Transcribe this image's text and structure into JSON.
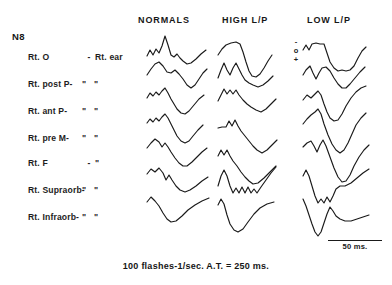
{
  "figure": {
    "subject_id": "N8",
    "caption": "100 flashes-1/sec.  A.T. = 250 ms.",
    "ink_color": "#1a1a1a",
    "background_color": "#ffffff"
  },
  "columns": [
    {
      "id": "normals",
      "label": "NORMALS"
    },
    {
      "id": "high_lp",
      "label": "HIGH L/P"
    },
    {
      "id": "low_lp",
      "label": "LOW L/P"
    }
  ],
  "polarity_key": {
    "negative": "-",
    "zero": "o",
    "positive": "+"
  },
  "scale_bar": {
    "label": "50 ms."
  },
  "rows": [
    {
      "site": "Rt. O",
      "dash": "-",
      "reference": "Rt. ear"
    },
    {
      "site": "Rt. post P-",
      "dash": "\"",
      "reference": "\""
    },
    {
      "site": "Rt. ant P-",
      "dash": "\"",
      "reference": "\""
    },
    {
      "site": "Rt. pre M-",
      "dash": "\"",
      "reference": "\""
    },
    {
      "site": "Rt. F",
      "dash": "-",
      "reference": "\""
    },
    {
      "site": "Rt. Supraorb-",
      "dash": "\"",
      "reference": "\""
    },
    {
      "site": "Rt. Infraorb-",
      "dash": "\"",
      "reference": "\""
    }
  ],
  "chart_data": {
    "type": "line",
    "xlabel": "time (ms)",
    "ylabel": "potential (polarity: - up, + down)",
    "x": [
      0,
      250
    ],
    "grid": false,
    "legend": "none",
    "annotations": [
      "100 flashes-1/sec.  A.T. = 250 ms.",
      "50 ms."
    ],
    "series": [
      {
        "name": "NORMALS / Rt. O - Rt. ear",
        "column": "normals",
        "row": 0,
        "path": "M147,56 L150,50 L153,55 L156,49 L159,53 L162,46 L165,36 L168,45 L171,55 L174,57 L177,54 L180,58 L183,61 L187,64 L191,63 L196,59 L201,54 L206,50"
      },
      {
        "name": "NORMALS / Rt. post P- \"",
        "column": "normals",
        "row": 1,
        "path": "M147,75 L151,69 L155,64 L159,62 L163,66 L167,72 L171,73 L175,70 L179,74 L183,79 L187,85 L191,88 L195,85 L199,79 L203,73 L207,69"
      },
      {
        "name": "NORMALS / Rt. ant P- \"",
        "column": "normals",
        "row": 2,
        "path": "M147,98 L150,93 L153,96 L156,92 L159,95 L162,91 L165,88 L168,93 L171,99 L174,104 L177,109 L181,113 L185,114 L189,111 L194,105 L199,99 L204,95"
      },
      {
        "name": "NORMALS / Rt. pre M- \"",
        "column": "normals",
        "row": 3,
        "path": "M147,123 L150,119 L153,122 L156,118 L159,121 L162,117 L165,114 L168,118 L171,124 L174,130 L177,136 L181,141 L185,143 L189,141 L193,136 L198,130 L203,125"
      },
      {
        "name": "NORMALS / Rt. F - \"",
        "column": "normals",
        "row": 4,
        "path": "M147,148 L151,143 L155,139 L159,142 L162,147 L165,143 L168,147 L171,152 L175,158 L179,163 L183,166 L187,166 L192,162 L197,157 L202,152 L207,148"
      },
      {
        "name": "NORMALS / Rt. Supraorb- \"",
        "column": "normals",
        "row": 5,
        "path": "M147,174 L151,169 L155,172 L159,168 L163,173 L166,180 L169,175 L172,180 L176,186 L180,190 L185,192 L190,190 L196,186 L202,181 L208,177"
      },
      {
        "name": "NORMALS / Rt. Infraorb- \"",
        "column": "normals",
        "row": 6,
        "path": "M147,202 L151,197 L155,201 L159,206 L163,213 L167,219 L171,222 L176,221 L182,216 L188,210 L195,205 L202,201 L209,198"
      },
      {
        "name": "HIGH L/P / Rt. O - Rt. ear",
        "column": "high_lp",
        "row": 0,
        "path": "M218,55 L222,49 L226,45 L231,43 L236,42 L240,44 L243,52 L246,62 L249,71 L252,76 L256,77 L260,74 L264,68 L268,61 L272,55"
      },
      {
        "name": "HIGH L/P / Rt. post P- \"",
        "column": "high_lp",
        "row": 1,
        "path": "M218,78 L221,70 L224,63 L227,70 L230,75 L233,68 L236,63 L239,69 L242,75 L245,80 L249,83 L253,85 L258,87 L263,85 L268,81 L273,76"
      },
      {
        "name": "HIGH L/P / Rt. ant P- \"",
        "column": "high_lp",
        "row": 2,
        "path": "M218,101 L221,95 L224,89 L227,94 L230,90 L233,94 L236,90 L239,95 L243,100 L247,104 L251,107 L256,110 L261,112 L266,109 L271,104 L276,99"
      },
      {
        "name": "HIGH L/P / Rt. pre M- \"",
        "column": "high_lp",
        "row": 3,
        "path": "M218,128 L222,127 L226,127 L229,121 L232,126 L235,120 L238,126 L241,131 L245,136 L249,141 L253,146 L257,150 L262,153 L267,150 L272,145 L277,140"
      },
      {
        "name": "HIGH L/P / Rt. F - \"",
        "column": "high_lp",
        "row": 4,
        "path": "M218,156 L221,150 L224,155 L227,150 L230,156 L233,161 L237,166 L241,172 L245,177 L249,181 L253,184 L258,183 L264,178 L270,172 L276,166"
      },
      {
        "name": "HIGH L/P / Rt. Supraorb- \"",
        "column": "high_lp",
        "row": 5,
        "path": "M218,186 L221,176 L224,170 L227,176 L230,186 L233,193 L236,188 L239,193 L242,187 L245,193 L248,187 L251,193 L254,189 L257,193 L261,187 L266,180 L271,173 L276,167"
      },
      {
        "name": "HIGH L/P / Rt. Infraorb- \"",
        "column": "high_lp",
        "row": 6,
        "path": "M218,205 L221,199 L224,204 L227,215 L230,224 L234,230 L238,232 L243,229 L248,222 L254,214 L260,208 L267,204 L274,202"
      },
      {
        "name": "LOW L/P / Rt. O - Rt. ear",
        "column": "low_lp",
        "row": 0,
        "path": "M303,50 L306,45 L309,50 L312,44 L316,43 L320,44 L324,44 L327,53 L330,62 L334,68 L338,71 L342,70 L346,71 L350,70 L354,66 L358,58 L362,51 L366,47"
      },
      {
        "name": "LOW L/P / Rt. post P- \"",
        "column": "low_lp",
        "row": 1,
        "path": "M303,75 L306,70 L310,66 L313,73 L316,79 L319,73 L322,68 L326,67 L330,71 L334,78 L338,84 L342,88 L346,88 L350,84 L355,78 L360,72 L365,67"
      },
      {
        "name": "LOW L/P / Rt. ant P- \"",
        "column": "low_lp",
        "row": 2,
        "path": "M303,100 L307,95 L311,98 L315,94 L318,91 L321,95 L324,104 L327,112 L330,118 L334,121 L338,120 L342,114 L346,106 L351,98 L356,92 L361,88 L366,86"
      },
      {
        "name": "LOW L/P / Rt. pre M- \"",
        "column": "low_lp",
        "row": 3,
        "path": "M303,124 L307,119 L311,115 L315,112 L318,109 L321,114 L324,124 L328,135 L332,144 L336,150 L340,153 L344,150 L348,143 L352,134 L356,125 L361,118 L366,113"
      },
      {
        "name": "LOW L/P / Rt. F - \"",
        "column": "low_lp",
        "row": 4,
        "path": "M303,147 L307,143 L311,141 L314,146 L317,152 L320,145 L323,140 L326,146 L330,157 L334,168 L338,177 L342,182 L346,181 L350,175 L354,166 L359,157 L364,150 L369,145"
      },
      {
        "name": "LOW L/P / Rt. Supraorb- \"",
        "column": "low_lp",
        "row": 5,
        "path": "M303,176 L306,170 L309,176 L312,186 L315,196 L318,203 L321,199 L324,203 L327,197 L330,202 L333,196 L336,189 L340,186 L345,186 L351,183 L357,178 L363,173 L369,169"
      },
      {
        "name": "LOW L/P / Rt. Infraorb- \"",
        "column": "low_lp",
        "row": 6,
        "path": "M303,199 L306,206 L309,215 L312,224 L315,232 L318,236 L321,232 L324,223 L327,214 L330,207 L333,211 L336,216 L340,219 L345,221 L351,221 L357,219 L363,217 L369,215"
      }
    ]
  }
}
